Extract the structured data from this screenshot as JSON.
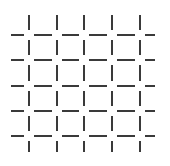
{
  "figure": {
    "background_color": "#ffffff",
    "line_color": "#3a3a3a",
    "canvas": {
      "width": 170,
      "height": 166
    }
  },
  "chart_data": {
    "type": "scatter",
    "xlabel": "",
    "ylabel": "",
    "grid": true,
    "legend_position": "none",
    "xlim": [
      0,
      170
    ],
    "ylim": [
      0,
      166
    ],
    "vertical_line_x": [
      29,
      57,
      84,
      112,
      140
    ],
    "horizontal_line_y": [
      35,
      60,
      86,
      111,
      136
    ],
    "vertical_line_extent": [
      15,
      152
    ],
    "horizontal_line_extent": [
      11,
      155
    ],
    "line_width": 2,
    "intersection_gap": 5,
    "columns": 5,
    "rows": 5,
    "cells": 16,
    "tick_labels_x": [],
    "tick_labels_y": []
  }
}
